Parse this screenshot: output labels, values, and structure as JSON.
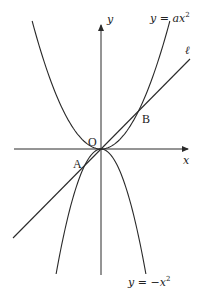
{
  "diagram": {
    "axes": {
      "x_label": "x",
      "y_label": "y",
      "origin_label": "O"
    },
    "curves": [
      {
        "id": "upper-parabola",
        "label": "y = ax²",
        "label_parts": [
          "y",
          " = ",
          "ax",
          "2"
        ],
        "equation": "y = ax^2"
      },
      {
        "id": "lower-parabola",
        "label": "y = −x²",
        "label_parts": [
          "y",
          " = −",
          "x",
          "2"
        ],
        "equation": "y = -x^2"
      }
    ],
    "line": {
      "id": "line-l",
      "label": "ℓ"
    },
    "points": [
      {
        "name": "A",
        "on": [
          "line-l",
          "lower-parabola"
        ]
      },
      {
        "name": "B",
        "on": [
          "line-l",
          "upper-parabola"
        ]
      },
      {
        "name": "O",
        "on": [
          "line-l",
          "upper-parabola",
          "lower-parabola"
        ]
      }
    ]
  }
}
